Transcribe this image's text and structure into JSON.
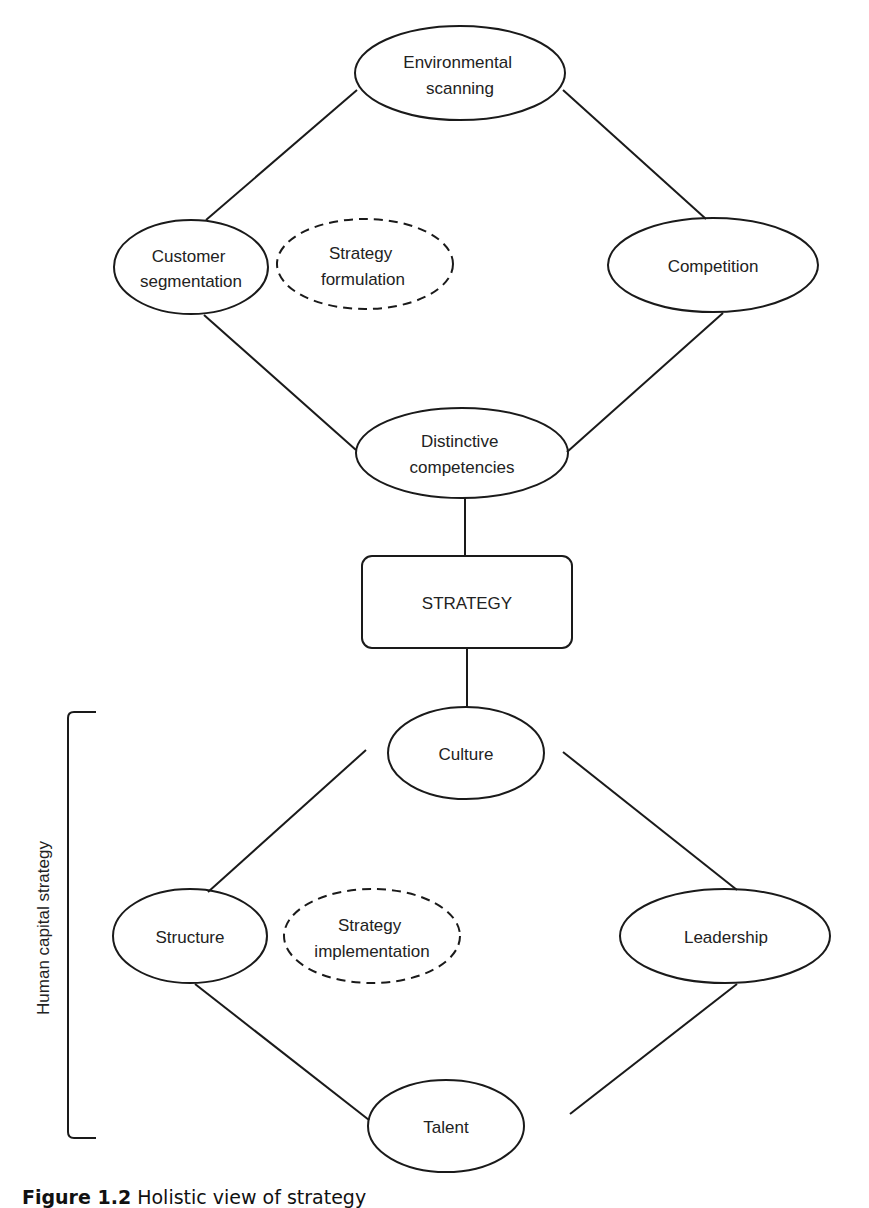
{
  "figure": {
    "caption_label": "Figure 1.2",
    "caption_text": "Holistic view of strategy"
  },
  "formulation": {
    "environmental_scanning": [
      "Environmental",
      "scanning"
    ],
    "customer_segmentation": [
      "Customer",
      "segmentation"
    ],
    "competition": [
      "Competition"
    ],
    "distinctive_competencies": [
      "Distinctive",
      "competencies"
    ],
    "center": [
      "Strategy",
      "formulation"
    ]
  },
  "strategy": {
    "label": "STRATEGY"
  },
  "implementation": {
    "culture": [
      "Culture"
    ],
    "structure": [
      "Structure"
    ],
    "leadership": [
      "Leadership"
    ],
    "talent": [
      "Talent"
    ],
    "center": [
      "Strategy",
      "implementation"
    ]
  },
  "bracket": {
    "label": "Human capital strategy"
  },
  "colors": {
    "stroke": "#1a1a1a",
    "text": "#222222",
    "background": "#ffffff"
  }
}
